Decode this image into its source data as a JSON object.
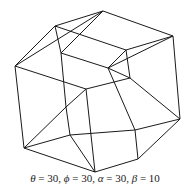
{
  "figure": {
    "line_color": "#1a1a1a",
    "vertices": [
      [
        103,
        11
      ],
      [
        173,
        36
      ],
      [
        55,
        26
      ],
      [
        126,
        50
      ],
      [
        15,
        66
      ],
      [
        86,
        89
      ],
      [
        61,
        53
      ],
      [
        130,
        78
      ],
      [
        108,
        68
      ],
      [
        180,
        119
      ],
      [
        66,
        107
      ],
      [
        135,
        130
      ],
      [
        24,
        148
      ],
      [
        95,
        172
      ],
      [
        70,
        135
      ],
      [
        138,
        159
      ]
    ],
    "edges": [
      [
        0,
        1
      ],
      [
        0,
        2
      ],
      [
        1,
        3
      ],
      [
        2,
        3
      ],
      [
        4,
        5
      ],
      [
        4,
        12
      ],
      [
        5,
        13
      ],
      [
        12,
        13
      ],
      [
        0,
        4
      ],
      [
        1,
        9
      ],
      [
        2,
        6
      ],
      [
        3,
        7
      ],
      [
        9,
        15
      ],
      [
        13,
        15
      ],
      [
        5,
        7
      ],
      [
        7,
        9
      ],
      [
        6,
        8
      ],
      [
        8,
        7
      ],
      [
        6,
        10
      ],
      [
        8,
        11
      ],
      [
        10,
        14
      ],
      [
        11,
        14
      ],
      [
        10,
        5
      ],
      [
        14,
        13
      ],
      [
        2,
        4
      ],
      [
        3,
        8
      ],
      [
        12,
        14
      ],
      [
        15,
        11
      ],
      [
        6,
        0
      ],
      [
        11,
        9
      ],
      [
        10,
        12
      ],
      [
        8,
        1
      ]
    ]
  },
  "caption": {
    "theta_sym": "θ",
    "theta": " = 30, ",
    "phi_sym": "ϕ",
    "phi": " = 30, ",
    "alpha_sym": "α",
    "alpha": " = 30, ",
    "beta_sym": "β",
    "beta": " = 10"
  }
}
